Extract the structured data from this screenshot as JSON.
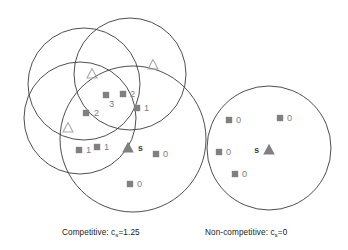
{
  "figure": {
    "title": "",
    "background_color": "#ffffff",
    "width": 348,
    "height": 250
  },
  "captions": {
    "left": {
      "prefix": "Competitive: c",
      "subscript": "s",
      "suffix": "=1.25",
      "full_text": "Competitive: c_s=1.25"
    },
    "right": {
      "prefix": "Non-competitive: c",
      "subscript": "s",
      "suffix": "=0",
      "full_text": "Non-competitive: c_s=0"
    }
  },
  "colors": {
    "circle_stroke": "#3a3a3a",
    "square_fill": "#808080",
    "triangle_filled_fill": "#808080",
    "triangle_open_stroke": "#a8a8a8",
    "label_color": "#808080",
    "caption_color": "#1a1a1a"
  },
  "chart_data": {
    "type": "diagram",
    "panels": [
      {
        "name": "competitive",
        "caption": "Competitive: c_s=1.25",
        "coverage_value": 1.25,
        "circles": [
          {
            "id": "circle-upper-left",
            "cx": 84,
            "cy": 84,
            "r": 56
          },
          {
            "id": "circle-upper-right",
            "cx": 130,
            "cy": 74,
            "r": 56
          },
          {
            "id": "circle-left",
            "cx": 80,
            "cy": 118,
            "r": 56
          },
          {
            "id": "circle-lower-right",
            "cx": 133,
            "cy": 139,
            "r": 73
          }
        ],
        "squares": [
          {
            "x": 106,
            "y": 95,
            "label": "3",
            "label_dx": 3,
            "label_dy": 9
          },
          {
            "x": 123,
            "y": 94,
            "label": "2",
            "label_dx": 7,
            "label_dy": 0
          },
          {
            "x": 86,
            "y": 113,
            "label": "2",
            "label_dx": 8,
            "label_dy": 0
          },
          {
            "x": 137,
            "y": 108,
            "label": "1",
            "label_dx": 7,
            "label_dy": 0
          },
          {
            "x": 79,
            "y": 150,
            "label": "1",
            "label_dx": 7,
            "label_dy": 0
          },
          {
            "x": 97,
            "y": 147,
            "label": "1",
            "label_dx": 7,
            "label_dy": 0
          },
          {
            "x": 156,
            "y": 154,
            "label": "0",
            "label_dx": 7,
            "label_dy": 0
          },
          {
            "x": 130,
            "y": 184,
            "label": "0",
            "label_dx": 7,
            "label_dy": 0
          }
        ],
        "triangles_open": [
          {
            "x": 92,
            "y": 74
          },
          {
            "x": 153,
            "y": 65
          },
          {
            "x": 68,
            "y": 128
          }
        ],
        "triangles_filled": [
          {
            "x": 128,
            "y": 148,
            "label": "s",
            "label_side": "right"
          }
        ]
      },
      {
        "name": "non-competitive",
        "caption": "Non-competitive: c_s=0",
        "coverage_value": 0,
        "circles": [
          {
            "id": "circle-single",
            "cx": 269,
            "cy": 148,
            "r": 62
          }
        ],
        "squares": [
          {
            "x": 229,
            "y": 120,
            "label": "0",
            "label_dx": 7,
            "label_dy": 0
          },
          {
            "x": 280,
            "y": 118,
            "label": "0",
            "label_dx": 7,
            "label_dy": 0
          },
          {
            "x": 219,
            "y": 152,
            "label": "0",
            "label_dx": 7,
            "label_dy": 0
          },
          {
            "x": 235,
            "y": 174,
            "label": "0",
            "label_dx": 7,
            "label_dy": 0
          }
        ],
        "triangles_open": [],
        "triangles_filled": [
          {
            "x": 269,
            "y": 150,
            "label": "s",
            "label_side": "left"
          }
        ]
      }
    ],
    "legend": []
  }
}
